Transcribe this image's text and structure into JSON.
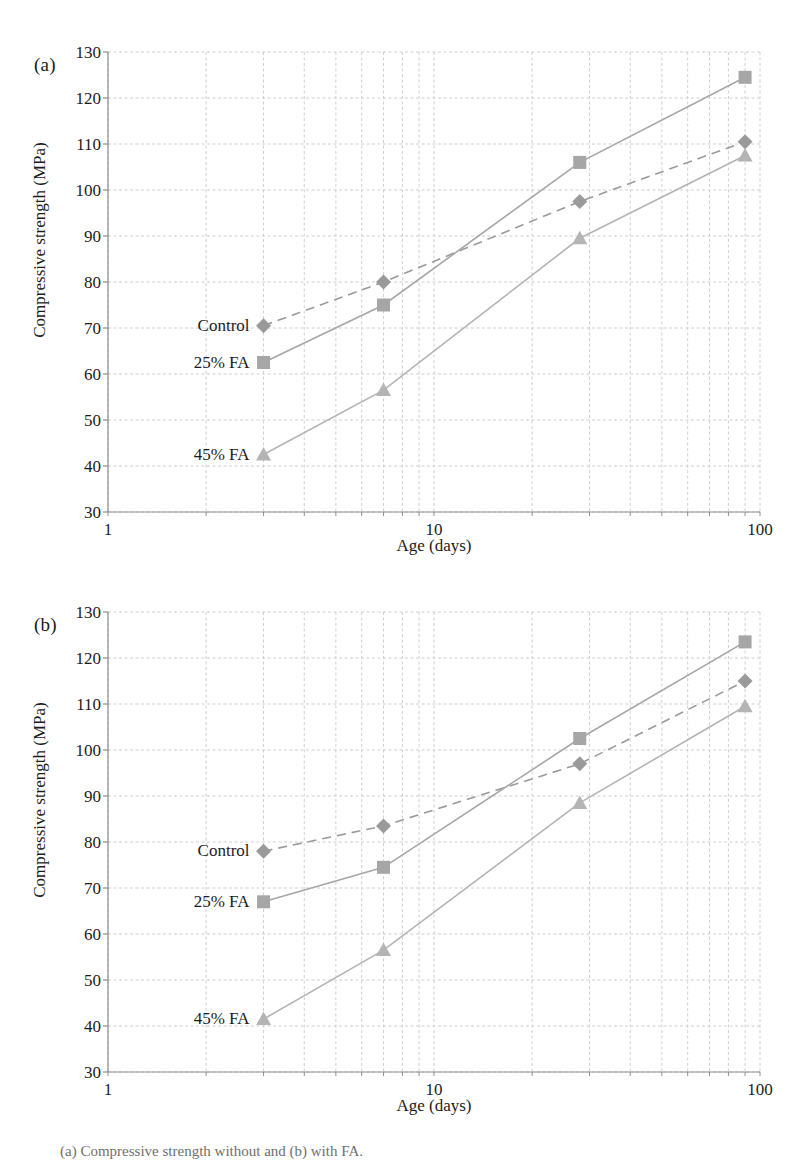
{
  "figure": {
    "caption": "(a) Compressive strength without and (b) with FA.",
    "axis_label_x": "Age (days)",
    "axis_label_y": "Compressive strength (MPa)",
    "colors": {
      "control": "#9a9a9a",
      "fa25": "#a6a6a6",
      "fa45": "#b4b4b4",
      "grid": "#cfcfd6",
      "axis": "#8d8d8d",
      "text": "#1c1c1c"
    }
  },
  "panels": [
    {
      "tag": "(a)",
      "chart_data": {
        "type": "line",
        "title": "",
        "xlabel": "Age (days)",
        "ylabel": "Compressive strength (MPa)",
        "xscale": "log",
        "xlim": [
          1,
          100
        ],
        "ylim": [
          30,
          130
        ],
        "xticks": [
          "1",
          "10",
          "100"
        ],
        "xtick_values": [
          1,
          10,
          100
        ],
        "yticks": [
          "30",
          "40",
          "50",
          "60",
          "70",
          "80",
          "90",
          "100",
          "110",
          "120",
          "130"
        ],
        "ytick_values": [
          30,
          40,
          50,
          60,
          70,
          80,
          90,
          100,
          110,
          120,
          130
        ],
        "grid": true,
        "legend_position": "inline-left",
        "x": [
          3,
          7,
          28,
          90
        ],
        "series": [
          {
            "name": "Control",
            "marker": "diamond",
            "dash": "dashed",
            "values": [
              70.5,
              80.0,
              97.5,
              110.5
            ]
          },
          {
            "name": "25% FA",
            "marker": "square",
            "dash": "solid",
            "values": [
              62.5,
              75.0,
              106.0,
              124.5
            ]
          },
          {
            "name": "45% FA",
            "marker": "triangle",
            "dash": "solid",
            "values": [
              42.5,
              56.5,
              89.5,
              107.5
            ]
          }
        ],
        "annotations": [
          {
            "text": "Control",
            "x": 3,
            "y": 70.5
          },
          {
            "text": "25% FA",
            "x": 3,
            "y": 62.5
          },
          {
            "text": "45% FA",
            "x": 3,
            "y": 42.5
          }
        ]
      }
    },
    {
      "tag": "(b)",
      "chart_data": {
        "type": "line",
        "title": "",
        "xlabel": "Age (days)",
        "ylabel": "Compressive strength (MPa)",
        "xscale": "log",
        "xlim": [
          1,
          100
        ],
        "ylim": [
          30,
          130
        ],
        "xticks": [
          "1",
          "10",
          "100"
        ],
        "xtick_values": [
          1,
          10,
          100
        ],
        "yticks": [
          "30",
          "40",
          "50",
          "60",
          "70",
          "80",
          "90",
          "100",
          "110",
          "120",
          "130"
        ],
        "ytick_values": [
          30,
          40,
          50,
          60,
          70,
          80,
          90,
          100,
          110,
          120,
          130
        ],
        "grid": true,
        "legend_position": "inline-left",
        "x": [
          3,
          7,
          28,
          90
        ],
        "series": [
          {
            "name": "Control",
            "marker": "diamond",
            "dash": "dashed",
            "values": [
              78.0,
              83.5,
              97.0,
              115.0
            ]
          },
          {
            "name": "25% FA",
            "marker": "square",
            "dash": "solid",
            "values": [
              67.0,
              74.5,
              102.5,
              123.5
            ]
          },
          {
            "name": "45% FA",
            "marker": "triangle",
            "dash": "solid",
            "values": [
              41.5,
              56.5,
              88.5,
              109.5
            ]
          }
        ],
        "annotations": [
          {
            "text": "Control",
            "x": 3,
            "y": 78.0
          },
          {
            "text": "25% FA",
            "x": 3,
            "y": 67.0
          },
          {
            "text": "45% FA",
            "x": 3,
            "y": 41.5
          }
        ]
      }
    }
  ]
}
